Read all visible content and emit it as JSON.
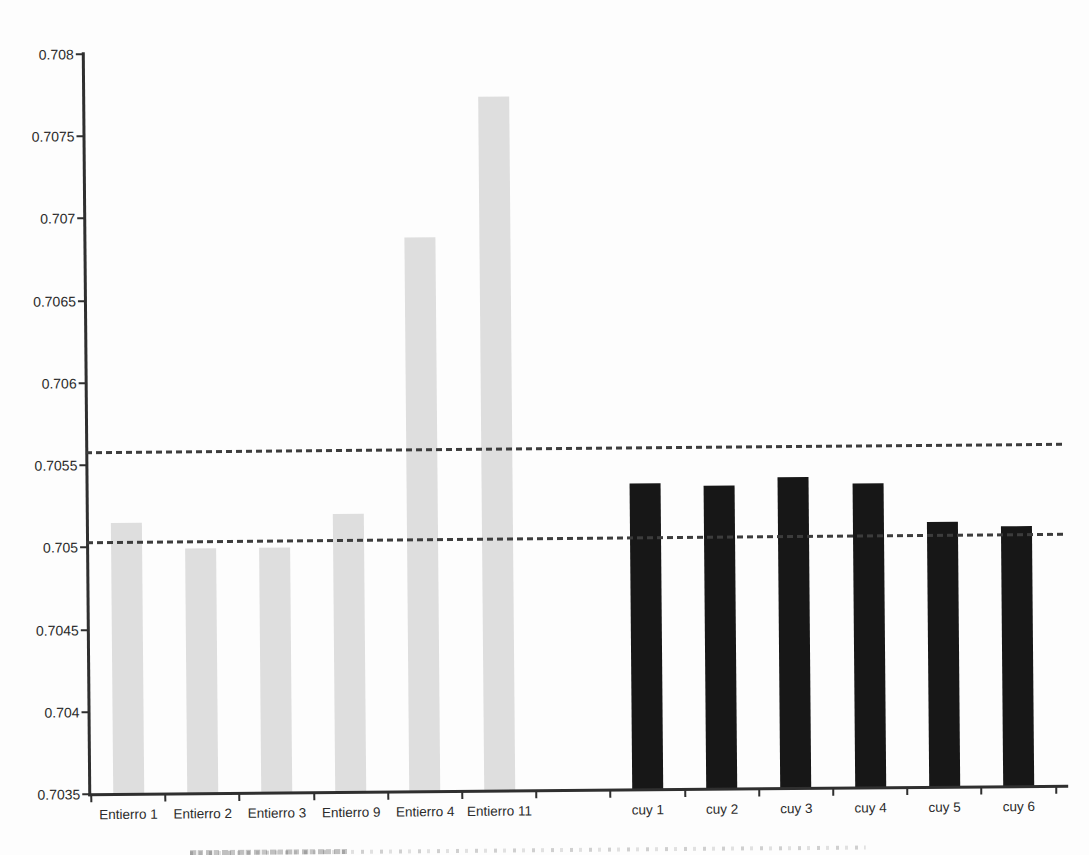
{
  "chart_data": {
    "type": "bar",
    "title": "",
    "xlabel": "",
    "ylabel": "",
    "ylim": [
      0.7035,
      0.708
    ],
    "ytick_step": 0.0005,
    "ytick_labels": [
      "0.708",
      "0.7075",
      "0.707",
      "0.7065",
      "0.706",
      "0.7055",
      "0.705",
      "0.7045",
      "0.704",
      "0.7035"
    ],
    "grid": false,
    "legend": false,
    "group_gap_slots": 1,
    "bar_groups": [
      {
        "name": "entierros",
        "fill_color": "#dedede",
        "bars": [
          {
            "label": "Entierro 1",
            "value": 0.70515
          },
          {
            "label": "Entierro 2",
            "value": 0.70499
          },
          {
            "label": "Entierro 3",
            "value": 0.70499
          },
          {
            "label": "Entierro 9",
            "value": 0.70519
          },
          {
            "label": "Entierro 4",
            "value": 0.70687
          },
          {
            "label": "Entierro 11",
            "value": 0.70772
          }
        ]
      },
      {
        "name": "cuyes",
        "fill_color": "#171717",
        "bars": [
          {
            "label": "cuy 1",
            "value": 0.70536
          },
          {
            "label": "cuy 2",
            "value": 0.70534
          },
          {
            "label": "cuy 3",
            "value": 0.70539
          },
          {
            "label": "cuy 4",
            "value": 0.70535
          },
          {
            "label": "cuy 5",
            "value": 0.70511
          },
          {
            "label": "cuy 6",
            "value": 0.70508
          }
        ]
      }
    ],
    "reference_lines": [
      {
        "name": "upper-dashed-line",
        "value": 0.70558,
        "style": "dashed",
        "color": "#3c3c3c"
      },
      {
        "name": "lower-dashed-line",
        "value": 0.70503,
        "style": "dashed",
        "color": "#3c3c3c"
      }
    ],
    "axis_color": "#2f2f2f",
    "text_color": "#2b2b2b",
    "background_color": "#fdfdfd"
  }
}
